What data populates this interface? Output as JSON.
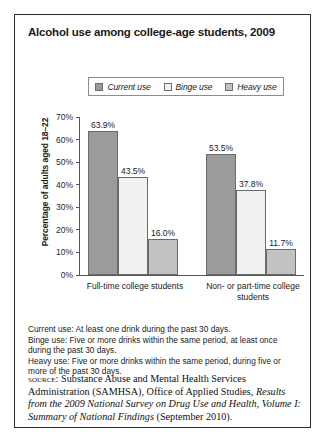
{
  "figure": {
    "title": "Alcohol use among college-age students, 2009"
  },
  "chart_data": {
    "type": "bar",
    "title": "Alcohol use among college-age students, 2009",
    "xlabel": "",
    "ylabel": "Percentage of adults aged 18–22",
    "ylim": [
      0,
      70
    ],
    "ytick_labels": [
      "70%",
      "60%",
      "50%",
      "40%",
      "30%",
      "20%",
      "10%",
      "0%"
    ],
    "ytick_values": [
      70,
      60,
      50,
      40,
      30,
      20,
      10,
      0
    ],
    "grid": false,
    "legend_position": "top-center",
    "categories": [
      "Full-time college students",
      "Non- or part-time college students"
    ],
    "series": [
      {
        "name": "Current use",
        "color": "#9b9b9b",
        "values": [
          63.9,
          53.5
        ],
        "labels": [
          "63.9%",
          "53.5%"
        ]
      },
      {
        "name": "Binge use",
        "color": "#f1f1f1",
        "values": [
          43.5,
          37.8
        ],
        "labels": [
          "43.5%",
          "37.8%"
        ]
      },
      {
        "name": "Heavy use",
        "color": "#c2c2c2",
        "values": [
          16.0,
          11.7
        ],
        "labels": [
          "16.0%",
          "11.7%"
        ]
      }
    ]
  },
  "notes": [
    "Current use: At least one drink during the past 30 days.",
    "Binge use: Five or more drinks within the same period, at least once during the past 30 days.",
    "Heavy use: Five or more drinks within the same period, during five or more of the past 30 days."
  ],
  "source": {
    "label": "source:",
    "text_before": " Substance Abuse and Mental Health Services Administration (SAMHSA), Office of Applied Studies, ",
    "title_italic": "Results from the 2009 National Survey on Drug Use and Health, Volume I: Summary of National Findings",
    "text_after": " (September 2010)."
  }
}
